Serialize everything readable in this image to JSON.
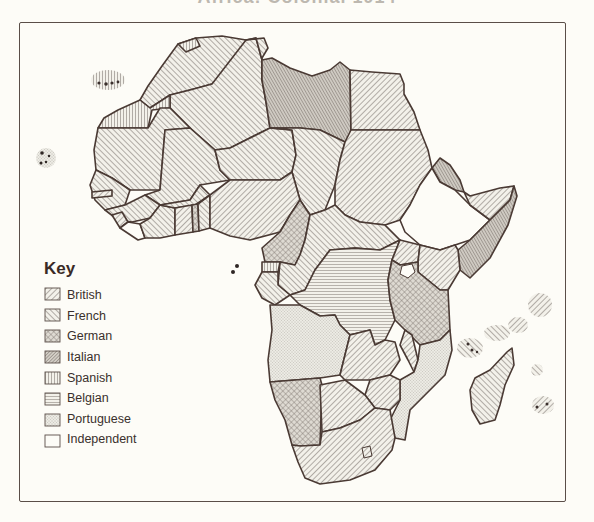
{
  "map": {
    "title": "Africa: Colonial 1914",
    "title_visible": "partially cropped",
    "key": {
      "heading": "Key",
      "items": [
        {
          "id": "british",
          "label": "British",
          "pattern": "diagonal-up-right"
        },
        {
          "id": "french",
          "label": "French",
          "pattern": "diagonal-down-right"
        },
        {
          "id": "german",
          "label": "German",
          "pattern": "crosshatch"
        },
        {
          "id": "italian",
          "label": "Italian",
          "pattern": "dense-diagonal"
        },
        {
          "id": "spanish",
          "label": "Spanish",
          "pattern": "vertical-lines"
        },
        {
          "id": "belgian",
          "label": "Belgian",
          "pattern": "horizontal-lines"
        },
        {
          "id": "portuguese",
          "label": "Portuguese",
          "pattern": "stipple"
        },
        {
          "id": "independent",
          "label": "Independent",
          "pattern": "blank"
        }
      ]
    },
    "colors": {
      "background": "#fdfcf7",
      "ink": "#4a3a34",
      "hatch": "#6e6560",
      "shaded": "#c9c4bc"
    }
  }
}
